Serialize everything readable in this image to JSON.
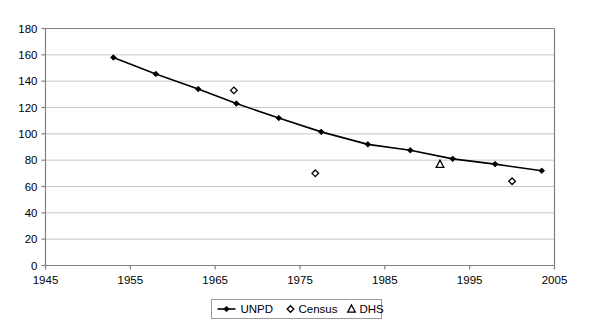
{
  "chart_data": {
    "type": "line",
    "title": "",
    "xlabel": "",
    "ylabel": "",
    "xlim": [
      1945,
      2005
    ],
    "ylim": [
      0,
      180
    ],
    "x_ticks": [
      1945,
      1955,
      1965,
      1975,
      1985,
      1995,
      2005
    ],
    "y_ticks": [
      0,
      20,
      40,
      60,
      80,
      100,
      120,
      140,
      160,
      180
    ],
    "grid": "horizontal",
    "legend_position": "bottom",
    "series": [
      {
        "name": "UNPD",
        "marker": "solid-diamond",
        "style": "line-with-markers",
        "points": [
          {
            "x": 1953,
            "y": 158
          },
          {
            "x": 1958,
            "y": 145.5
          },
          {
            "x": 1963,
            "y": 134
          },
          {
            "x": 1967.5,
            "y": 123
          },
          {
            "x": 1972.5,
            "y": 112
          },
          {
            "x": 1977.5,
            "y": 101.5
          },
          {
            "x": 1983,
            "y": 92
          },
          {
            "x": 1988,
            "y": 87.5
          },
          {
            "x": 1993,
            "y": 81
          },
          {
            "x": 1998,
            "y": 77
          },
          {
            "x": 2003.5,
            "y": 72
          }
        ]
      },
      {
        "name": "Census",
        "marker": "open-diamond",
        "style": "markers-only",
        "points": [
          {
            "x": 1967.2,
            "y": 133
          },
          {
            "x": 1976.8,
            "y": 70
          },
          {
            "x": 2000,
            "y": 64
          }
        ]
      },
      {
        "name": "DHS",
        "marker": "open-triangle",
        "style": "markers-only",
        "points": [
          {
            "x": 1991.5,
            "y": 77
          }
        ]
      }
    ]
  },
  "legend": {
    "entries": [
      {
        "label": "UNPD",
        "marker": "solid-diamond-line"
      },
      {
        "label": "Census",
        "marker": "open-diamond"
      },
      {
        "label": "DHS",
        "marker": "open-triangle"
      }
    ]
  },
  "colors": {
    "series": "#000000",
    "grid": "#c8c8c8",
    "axis": "#808080",
    "background": "#ffffff"
  }
}
